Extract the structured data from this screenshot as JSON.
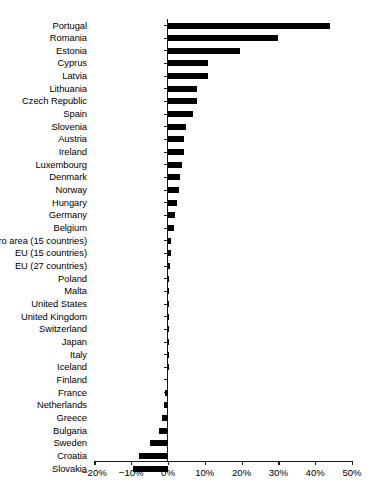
{
  "chart_data": {
    "type": "bar",
    "orientation": "horizontal",
    "title": "",
    "subtitle": "",
    "xlabel": "",
    "ylabel": "",
    "xlim": [
      -20,
      50
    ],
    "xticks": [
      -20,
      -10,
      0,
      10,
      20,
      30,
      40,
      50
    ],
    "xticklabels": [
      "−20%",
      "−10%",
      "0%",
      "10%",
      "20%",
      "30%",
      "40%",
      "50%"
    ],
    "grid": false,
    "legend": null,
    "bar_color": "#000000",
    "categories": [
      "Portugal",
      "Romania",
      "Estonia",
      "Cyprus",
      "Latvia",
      "Lithuania",
      "Czech Republic",
      "Spain",
      "Slovenia",
      "Austria",
      "Ireland",
      "Luxembourg",
      "Denmark",
      "Norway",
      "Hungary",
      "Germany",
      "Belgium",
      "Euro area (15 countries)",
      "EU (15 countries)",
      "EU (27 countries)",
      "Poland",
      "Malta",
      "United States",
      "United Kingdom",
      "Switzerland",
      "Japan",
      "Italy",
      "Iceland",
      "Finland",
      "France",
      "Netherlands",
      "Greece",
      "Bulgaria",
      "Sweden",
      "Croatia",
      "Slovakia"
    ],
    "values": [
      44.0,
      30.0,
      19.6,
      11.0,
      11.0,
      7.8,
      7.8,
      6.9,
      5.0,
      4.4,
      4.4,
      3.9,
      3.3,
      3.0,
      2.4,
      2.0,
      1.7,
      0.9,
      0.9,
      0.6,
      0.3,
      0.2,
      0.0,
      0.0,
      0.0,
      0.0,
      0.0,
      0.0,
      -0.4,
      -0.9,
      -1.0,
      -1.6,
      -2.5,
      -4.9,
      -8.0,
      -9.5
    ]
  }
}
